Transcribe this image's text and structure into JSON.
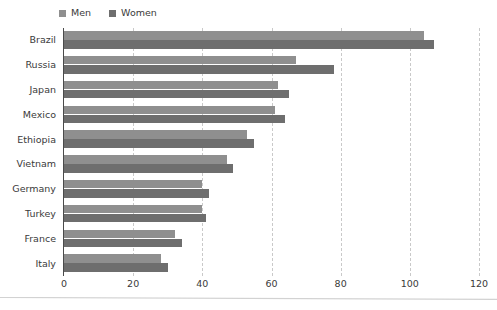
{
  "chart_data": {
    "type": "bar",
    "orientation": "horizontal",
    "title": "",
    "subtitle": "",
    "xlabel": "",
    "ylabel": "",
    "xlim": [
      0,
      120
    ],
    "xticks": [
      0,
      20,
      40,
      60,
      80,
      100,
      120
    ],
    "grid": true,
    "grid_axis": "x",
    "grid_style": "dashed",
    "legend_position": "top-left",
    "categories": [
      "Brazil",
      "Russia",
      "Japan",
      "Mexico",
      "Ethiopia",
      "Vietnam",
      "Germany",
      "Turkey",
      "France",
      "Italy"
    ],
    "series": [
      {
        "name": "Men",
        "color": "#8f8f8f",
        "values": [
          104,
          67,
          62,
          61,
          53,
          47,
          40,
          40,
          32,
          28
        ]
      },
      {
        "name": "Women",
        "color": "#6e6e6e",
        "values": [
          107,
          78,
          65,
          64,
          55,
          49,
          42,
          41,
          34,
          30
        ]
      }
    ]
  },
  "legend": {
    "items": [
      {
        "label": "Men",
        "color": "#8f8f8f"
      },
      {
        "label": "Women",
        "color": "#6e6e6e"
      }
    ]
  },
  "axis": {
    "tick_labels": [
      "0",
      "20",
      "40",
      "60",
      "80",
      "100",
      "120"
    ]
  },
  "colors": {
    "men": "#8f8f8f",
    "women": "#6e6e6e",
    "axis": "#4a4a4a",
    "grid": "#c9c9c9",
    "text": "#3a3a3a",
    "background": "#ffffff"
  }
}
